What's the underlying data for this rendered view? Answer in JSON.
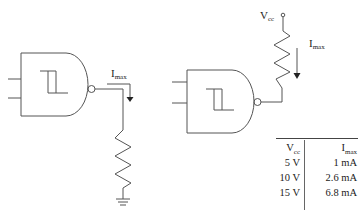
{
  "circuits": [
    {
      "name": "sink-configuration",
      "gate": "schmitt-trigger-nand",
      "current_label": {
        "main": "I",
        "sub": "max"
      },
      "load": "resistor-to-ground"
    },
    {
      "name": "source-configuration",
      "gate": "schmitt-trigger-nand",
      "supply_label": {
        "main": "V",
        "sub": "cc"
      },
      "current_label": {
        "main": "I",
        "sub": "max"
      },
      "load": "pull-up-resistor"
    }
  ],
  "table": {
    "headers": [
      {
        "main": "V",
        "sub": "cc"
      },
      {
        "main": "I",
        "sub": "max"
      }
    ],
    "rows": [
      {
        "vcc": "5 V",
        "imax": "1 mA"
      },
      {
        "vcc": "10 V",
        "imax": "2.6 mA"
      },
      {
        "vcc": "15 V",
        "imax": "6.8 mA"
      }
    ]
  },
  "colors": {
    "line": "#555555",
    "text": "#222222"
  }
}
